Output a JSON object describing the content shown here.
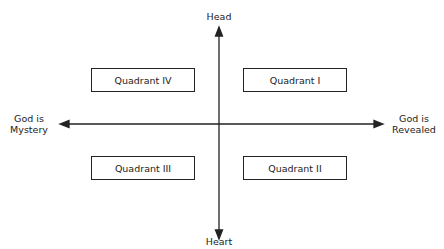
{
  "diagram": {
    "type": "quadrant",
    "axes": {
      "vertical": {
        "top_label": "Head",
        "bottom_label": "Heart"
      },
      "horizontal": {
        "left_label_line1": "God is",
        "left_label_line2": "Mystery",
        "right_label_line1": "God is",
        "right_label_line2": "Revealed"
      }
    },
    "quadrants": {
      "top_left": "Quadrant IV",
      "top_right": "Quadrant I",
      "bottom_left": "Quadrant III",
      "bottom_right": "Quadrant II"
    },
    "colors": {
      "line": "#222222",
      "background": "#ffffff"
    }
  }
}
